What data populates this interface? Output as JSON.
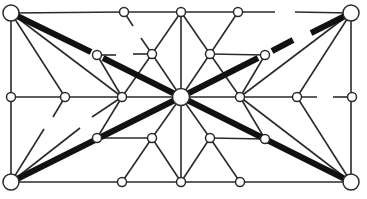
{
  "diagram": {
    "type": "geometric-graph",
    "width": 367,
    "height": 199,
    "colors": {
      "line": "#2a2a2a",
      "thick": "#111111",
      "node_fill": "#ffffff",
      "background": "#ffffff"
    },
    "nodes": [
      {
        "id": "TL",
        "x": 11,
        "y": 13,
        "r": 8,
        "kind": "corner"
      },
      {
        "id": "TR",
        "x": 351,
        "y": 13,
        "r": 8,
        "kind": "corner"
      },
      {
        "id": "BL",
        "x": 11,
        "y": 182,
        "r": 8,
        "kind": "corner"
      },
      {
        "id": "BR",
        "x": 351,
        "y": 182,
        "r": 8,
        "kind": "corner"
      },
      {
        "id": "C",
        "x": 181,
        "y": 97,
        "r": 8.5,
        "kind": "center"
      },
      {
        "id": "T1",
        "x": 124,
        "y": 12,
        "r": 4.5,
        "kind": "small"
      },
      {
        "id": "T2",
        "x": 181,
        "y": 12,
        "r": 4.5,
        "kind": "small"
      },
      {
        "id": "T3",
        "x": 238,
        "y": 12,
        "r": 4.5,
        "kind": "small"
      },
      {
        "id": "U1",
        "x": 97,
        "y": 55,
        "r": 4.5,
        "kind": "small"
      },
      {
        "id": "U2",
        "x": 152,
        "y": 54,
        "r": 4.5,
        "kind": "small"
      },
      {
        "id": "U3",
        "x": 210,
        "y": 54,
        "r": 4.5,
        "kind": "small"
      },
      {
        "id": "U4",
        "x": 265,
        "y": 55,
        "r": 4.5,
        "kind": "small"
      },
      {
        "id": "M1",
        "x": 11,
        "y": 97,
        "r": 4.5,
        "kind": "small"
      },
      {
        "id": "M2",
        "x": 65,
        "y": 97,
        "r": 4.5,
        "kind": "small"
      },
      {
        "id": "M3",
        "x": 122,
        "y": 97,
        "r": 4.5,
        "kind": "small"
      },
      {
        "id": "M4",
        "x": 240,
        "y": 97,
        "r": 4.5,
        "kind": "small"
      },
      {
        "id": "M5",
        "x": 297,
        "y": 97,
        "r": 4.5,
        "kind": "small"
      },
      {
        "id": "M6",
        "x": 352,
        "y": 97,
        "r": 4.5,
        "kind": "small"
      },
      {
        "id": "L1",
        "x": 97,
        "y": 138,
        "r": 4.5,
        "kind": "small"
      },
      {
        "id": "L2",
        "x": 152,
        "y": 138,
        "r": 4.5,
        "kind": "small"
      },
      {
        "id": "L3",
        "x": 210,
        "y": 138,
        "r": 4.5,
        "kind": "small"
      },
      {
        "id": "L4",
        "x": 265,
        "y": 139,
        "r": 4.5,
        "kind": "small"
      },
      {
        "id": "B1",
        "x": 122,
        "y": 182,
        "r": 4.5,
        "kind": "small"
      },
      {
        "id": "B2",
        "x": 181,
        "y": 182,
        "r": 4.5,
        "kind": "small"
      },
      {
        "id": "B3",
        "x": 240,
        "y": 182,
        "r": 4.5,
        "kind": "small"
      }
    ],
    "segments_thin": [
      [
        11,
        13,
        124,
        12
      ],
      [
        124,
        12,
        275,
        12
      ],
      [
        295,
        12,
        351,
        13
      ],
      [
        11,
        13,
        11,
        182
      ],
      [
        351,
        13,
        351,
        182
      ],
      [
        11,
        182,
        351,
        182
      ],
      [
        11,
        97,
        122,
        97
      ],
      [
        122,
        97,
        181,
        97
      ],
      [
        181,
        97,
        240,
        97
      ],
      [
        240,
        97,
        317,
        97
      ],
      [
        333,
        97,
        352,
        97
      ],
      [
        181,
        12,
        181,
        182
      ],
      [
        124,
        12,
        133,
        26
      ],
      [
        141,
        38,
        152,
        54
      ],
      [
        152,
        54,
        181,
        12
      ],
      [
        181,
        12,
        210,
        54
      ],
      [
        210,
        54,
        238,
        12
      ],
      [
        97,
        55,
        116,
        55
      ],
      [
        133,
        54,
        152,
        54
      ],
      [
        210,
        54,
        265,
        55
      ],
      [
        97,
        55,
        122,
        97
      ],
      [
        152,
        54,
        122,
        97
      ],
      [
        152,
        54,
        181,
        97
      ],
      [
        210,
        54,
        181,
        97
      ],
      [
        210,
        54,
        240,
        97
      ],
      [
        11,
        13,
        65,
        97
      ],
      [
        11,
        13,
        122,
        97
      ],
      [
        351,
        13,
        297,
        97
      ],
      [
        351,
        13,
        240,
        97
      ],
      [
        265,
        55,
        240,
        97
      ],
      [
        65,
        97,
        53,
        117
      ],
      [
        122,
        97,
        92,
        117
      ],
      [
        11,
        182,
        44,
        129
      ],
      [
        11,
        182,
        80,
        128
      ],
      [
        122,
        97,
        97,
        138
      ],
      [
        97,
        138,
        152,
        138
      ],
      [
        152,
        138,
        181,
        97
      ],
      [
        152,
        138,
        122,
        182
      ],
      [
        152,
        138,
        181,
        182
      ],
      [
        181,
        97,
        210,
        138
      ],
      [
        210,
        138,
        265,
        139
      ],
      [
        240,
        97,
        265,
        139
      ],
      [
        210,
        138,
        181,
        182
      ],
      [
        210,
        138,
        240,
        182
      ],
      [
        351,
        182,
        297,
        97
      ],
      [
        351,
        182,
        240,
        97
      ]
    ],
    "segments_thick": [
      [
        11,
        13,
        91,
        52
      ],
      [
        103,
        58,
        181,
        97
      ],
      [
        181,
        97,
        258,
        58
      ],
      [
        272,
        51,
        293,
        40
      ],
      [
        311,
        33,
        351,
        13
      ],
      [
        11,
        182,
        181,
        97
      ],
      [
        181,
        97,
        351,
        182
      ]
    ]
  }
}
